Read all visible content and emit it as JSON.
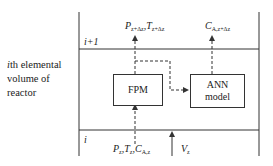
{
  "diagram": {
    "side_label": [
      "ith elemental",
      "volume of",
      "reactor"
    ],
    "level_top": "i+1",
    "level_bottom": "i",
    "boxes": {
      "fpm": "FPM",
      "ann": [
        "ANN",
        "model"
      ]
    },
    "outputs": {
      "p": "P",
      "p_sub": "z+Δz",
      "t": "T",
      "t_sub": "z+Δz",
      "c": "C",
      "c_sub": "A,z+Δz"
    },
    "inputs": {
      "p": "P",
      "p_sub": "z",
      "t": "T",
      "t_sub": "z",
      "c": "C",
      "c_sub": "A,z",
      "v": "V",
      "v_sub": "z"
    },
    "colors": {
      "line": "#333333",
      "background": "#ffffff"
    }
  }
}
